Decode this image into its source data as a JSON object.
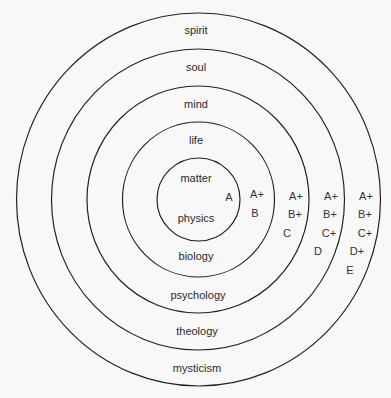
{
  "diagram": {
    "type": "concentric-circles",
    "center": {
      "x": 198.5,
      "y": 199.5
    },
    "rings": [
      {
        "level": "matter",
        "discipline": "physics",
        "rx": 41.5,
        "ry": 41.5
      },
      {
        "level": "life",
        "discipline": "biology",
        "rx": 76,
        "ry": 77.5
      },
      {
        "level": "mind",
        "discipline": "psychology",
        "rx": 111,
        "ry": 113.5
      },
      {
        "level": "soul",
        "discipline": "theology",
        "rx": 146.5,
        "ry": 150.5
      },
      {
        "level": "spirit",
        "discipline": "mysticism",
        "rx": 182,
        "ry": 186.5
      }
    ],
    "labels": {
      "spirit": "spirit",
      "soul": "soul",
      "mind": "mind",
      "life": "life",
      "matter": "matter",
      "physics": "physics",
      "biology": "biology",
      "psychology": "psychology",
      "theology": "theology",
      "mysticism": "mysticism"
    },
    "grades": {
      "physics": [
        "A"
      ],
      "biology": [
        "A+",
        "B"
      ],
      "psychology": [
        "A+",
        "B+",
        "C"
      ],
      "theology": [
        "A+",
        "B+",
        "C+",
        "D"
      ],
      "mysticism": [
        "A+",
        "B+",
        "C+",
        "D+",
        "E"
      ]
    }
  }
}
